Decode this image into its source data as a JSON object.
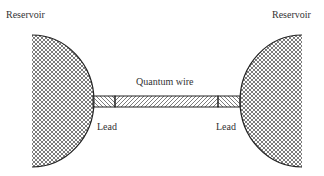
{
  "labels": {
    "reservoir_left": "Reservoir",
    "reservoir_right": "Reservoir",
    "wire": "Quantum wire",
    "lead_left": "Lead",
    "lead_right": "Lead"
  },
  "colors": {
    "stroke": "#222222",
    "text": "#333333",
    "background": "#ffffff"
  }
}
